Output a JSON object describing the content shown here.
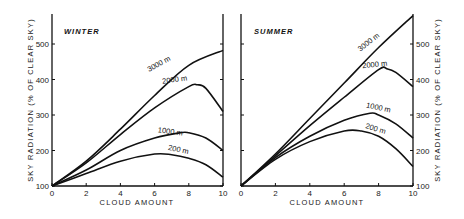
{
  "chart_data": [
    {
      "type": "line",
      "title": "WINTER",
      "xlabel": "CLOUD AMOUNT",
      "ylabel": "SKY RADIATION (% OF CLEAR SKY)",
      "xlim": [
        0,
        10
      ],
      "ylim": [
        100,
        580
      ],
      "xticks": [
        0,
        2,
        4,
        6,
        8,
        10
      ],
      "yticks": [
        100,
        200,
        300,
        400,
        500
      ],
      "grid": false,
      "series": [
        {
          "name": "3000 m",
          "x": [
            0,
            2,
            4,
            6,
            8,
            10
          ],
          "values": [
            100,
            170,
            260,
            355,
            440,
            482
          ]
        },
        {
          "name": "2000 m",
          "x": [
            0,
            2,
            4,
            6,
            8,
            8.5,
            9,
            10
          ],
          "values": [
            100,
            165,
            245,
            320,
            380,
            385,
            375,
            310
          ]
        },
        {
          "name": "1000 m",
          "x": [
            0,
            2,
            4,
            6,
            7.5,
            8,
            9,
            10
          ],
          "values": [
            100,
            145,
            200,
            235,
            250,
            250,
            235,
            200
          ]
        },
        {
          "name": "200 m",
          "x": [
            0,
            2,
            4,
            6,
            7,
            8,
            9,
            10
          ],
          "values": [
            100,
            135,
            170,
            190,
            188,
            178,
            160,
            125
          ]
        }
      ]
    },
    {
      "type": "line",
      "title": "SUMMER",
      "xlabel": "CLOUD AMOUNT",
      "ylabel": "SKY RADIATION (% OF CLEAR SKY)",
      "xlim": [
        0,
        10
      ],
      "ylim": [
        100,
        580
      ],
      "xticks": [
        0,
        2,
        4,
        6,
        8,
        10
      ],
      "yticks": [
        100,
        200,
        300,
        400,
        500
      ],
      "grid": false,
      "series": [
        {
          "name": "3000 m",
          "x": [
            0,
            2,
            4,
            6,
            8,
            10
          ],
          "values": [
            100,
            190,
            290,
            390,
            490,
            580
          ]
        },
        {
          "name": "2000 m",
          "x": [
            0,
            2,
            4,
            6,
            8,
            8.5,
            9,
            10
          ],
          "values": [
            100,
            185,
            270,
            350,
            428,
            430,
            420,
            380
          ]
        },
        {
          "name": "1000 m",
          "x": [
            0,
            2,
            4,
            6,
            7.5,
            8,
            9,
            10
          ],
          "values": [
            100,
            180,
            240,
            285,
            305,
            300,
            275,
            235
          ]
        },
        {
          "name": "200 m",
          "x": [
            0,
            2,
            4,
            6,
            7,
            8,
            9,
            10
          ],
          "values": [
            100,
            175,
            225,
            255,
            255,
            240,
            205,
            155
          ]
        }
      ]
    }
  ],
  "labels": {
    "winter_title": "WINTER",
    "summer_title": "SUMMER",
    "xlabel": "CLOUD AMOUNT",
    "ylabel": "SKY RADIATION (% OF CLEAR SKY)",
    "xticks": [
      "0",
      "2",
      "4",
      "6",
      "8",
      "10"
    ],
    "yticks": [
      "100",
      "200",
      "300",
      "400",
      "500"
    ],
    "curves": [
      "3000 m",
      "2000 m",
      "1000 m",
      "200 m"
    ]
  }
}
